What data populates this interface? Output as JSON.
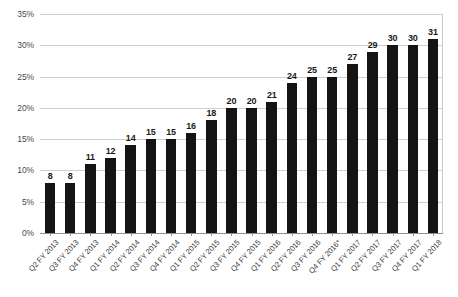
{
  "chart_data": {
    "type": "bar",
    "title": "",
    "subtitle": "",
    "xlabel": "",
    "ylabel": "",
    "ylim": [
      0,
      35
    ],
    "ytick_labels": [
      "0%",
      "5%",
      "10%",
      "15%",
      "20%",
      "25%",
      "30%",
      "35%"
    ],
    "ytick_values": [
      0,
      5,
      10,
      15,
      20,
      25,
      30,
      35
    ],
    "grid": true,
    "legend": "none",
    "bar_color": "#141414",
    "gridline_color": "#cfcfcf",
    "categories": [
      "Q2 FY 2013",
      "Q3 FY 2013",
      "Q4 FY 2013",
      "Q1 FY 2014",
      "Q2 FY 2014",
      "Q3 FY 2014",
      "Q4 FY 2014",
      "Q1 FY 2015",
      "Q2 FY 2015",
      "Q3 FY 2015",
      "Q4 FY 2015",
      "Q1 FY 2016",
      "Q2 FY 2016",
      "Q3 FY 2016",
      "Q4 FY 2016*",
      "Q1 FY 2017",
      "Q2 FY 2017",
      "Q3 FY 2017",
      "Q4 FY 2017",
      "Q1 FY 2018"
    ],
    "values": [
      8,
      8,
      11,
      12,
      14,
      15,
      15,
      16,
      18,
      20,
      20,
      21,
      24,
      25,
      25,
      27,
      29,
      30,
      30,
      31
    ],
    "data_labels": [
      "8",
      "8",
      "11",
      "12",
      "14",
      "15",
      "15",
      "16",
      "18",
      "20",
      "20",
      "21",
      "24",
      "25",
      "25",
      "27",
      "29",
      "30",
      "30",
      "31"
    ]
  }
}
